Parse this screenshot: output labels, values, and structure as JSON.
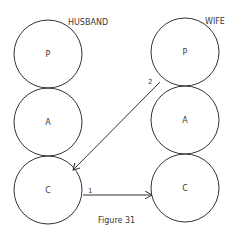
{
  "diagram": {
    "caption": "Figure 31",
    "columns": [
      {
        "label": "HUSBAND",
        "states": [
          "P",
          "A",
          "C"
        ]
      },
      {
        "label": "WIFE",
        "states": [
          "P",
          "A",
          "C"
        ]
      }
    ],
    "transactions": [
      {
        "number": "1",
        "from": "HUSBAND.C",
        "to": "WIFE.C"
      },
      {
        "number": "2",
        "from": "WIFE.P",
        "to": "HUSBAND.C"
      }
    ]
  }
}
